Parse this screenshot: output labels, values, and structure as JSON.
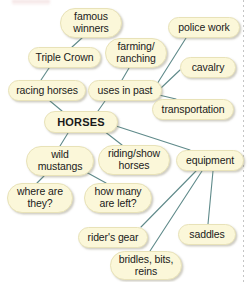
{
  "diagram": {
    "colors": {
      "node_fill": "#fbf7d9",
      "node_border": "#e8e2b8",
      "edge_line": "#5f8a8a",
      "text": "#1a1a1a",
      "background": "#ffffff"
    },
    "nodes": [
      {
        "id": "famous-winners",
        "label": "famous\nwinners",
        "x": 60,
        "y": 8,
        "w": 62,
        "h": 30,
        "central": false
      },
      {
        "id": "police-work",
        "label": "police work",
        "x": 168,
        "y": 17,
        "w": 72,
        "h": 21,
        "central": false
      },
      {
        "id": "farming-ranching",
        "label": "farming/\nranching",
        "x": 105,
        "y": 38,
        "w": 62,
        "h": 30,
        "central": false
      },
      {
        "id": "triple-crown",
        "label": "Triple Crown",
        "x": 28,
        "y": 47,
        "w": 73,
        "h": 21,
        "central": false
      },
      {
        "id": "cavalry",
        "label": "cavalry",
        "x": 180,
        "y": 57,
        "w": 56,
        "h": 21,
        "central": false
      },
      {
        "id": "racing-horses",
        "label": "racing horses",
        "x": 8,
        "y": 80,
        "w": 78,
        "h": 21,
        "central": false
      },
      {
        "id": "uses-in-past",
        "label": "uses in past",
        "x": 88,
        "y": 80,
        "w": 74,
        "h": 21,
        "central": false
      },
      {
        "id": "transportation",
        "label": "transportation",
        "x": 152,
        "y": 99,
        "w": 82,
        "h": 21,
        "central": false
      },
      {
        "id": "horses",
        "label": "HORSES",
        "x": 44,
        "y": 111,
        "w": 74,
        "h": 22,
        "central": true
      },
      {
        "id": "wild-mustangs",
        "label": "wild\nmustangs",
        "x": 26,
        "y": 146,
        "w": 68,
        "h": 30,
        "central": false
      },
      {
        "id": "riding-show-horses",
        "label": "riding/show\nhorses",
        "x": 98,
        "y": 145,
        "w": 72,
        "h": 30,
        "central": false
      },
      {
        "id": "equipment",
        "label": "equipment",
        "x": 176,
        "y": 150,
        "w": 68,
        "h": 21,
        "central": false
      },
      {
        "id": "where-are-they",
        "label": "where are\nthey?",
        "x": 7,
        "y": 183,
        "w": 66,
        "h": 30,
        "central": false
      },
      {
        "id": "how-many-left",
        "label": "how many\nare left?",
        "x": 84,
        "y": 183,
        "w": 68,
        "h": 30,
        "central": false
      },
      {
        "id": "riders-gear",
        "label": "rider's gear",
        "x": 78,
        "y": 227,
        "w": 70,
        "h": 21,
        "central": false
      },
      {
        "id": "saddles",
        "label": "saddles",
        "x": 178,
        "y": 224,
        "w": 58,
        "h": 21,
        "central": false
      },
      {
        "id": "bridles-bits-reins",
        "label": "bridles, bits,\nreins",
        "x": 110,
        "y": 251,
        "w": 72,
        "h": 29,
        "central": false
      }
    ],
    "edges": [
      {
        "id": "edge-triple-crown-famous-winners",
        "from": "triple-crown",
        "to": "famous-winners",
        "x1": 72,
        "y1": 47,
        "x2": 82,
        "y2": 38
      },
      {
        "id": "edge-racing-horses-triple-crown",
        "from": "racing-horses",
        "to": "triple-crown",
        "x1": 41,
        "y1": 80,
        "x2": 49,
        "y2": 68
      },
      {
        "id": "edge-racing-horses-horses",
        "from": "racing-horses",
        "to": "horses",
        "x1": 50,
        "y1": 101,
        "x2": 62,
        "y2": 111
      },
      {
        "id": "edge-uses-farming-ranching",
        "from": "uses-in-past",
        "to": "farming-ranching",
        "x1": 122,
        "y1": 80,
        "x2": 129,
        "y2": 68
      },
      {
        "id": "edge-uses-police-work",
        "from": "uses-in-past",
        "to": "police-work",
        "x1": 157,
        "y1": 84,
        "x2": 186,
        "y2": 38
      },
      {
        "id": "edge-uses-cavalry",
        "from": "uses-in-past",
        "to": "cavalry",
        "x1": 161,
        "y1": 88,
        "x2": 180,
        "y2": 70
      },
      {
        "id": "edge-uses-transportation",
        "from": "uses-in-past",
        "to": "transportation",
        "x1": 159,
        "y1": 95,
        "x2": 176,
        "y2": 99
      },
      {
        "id": "edge-uses-horses",
        "from": "uses-in-past",
        "to": "horses",
        "x1": 105,
        "y1": 101,
        "x2": 98,
        "y2": 111
      },
      {
        "id": "edge-horses-wild-mustangs",
        "from": "horses",
        "to": "wild-mustangs",
        "x1": 68,
        "y1": 133,
        "x2": 60,
        "y2": 146
      },
      {
        "id": "edge-horses-riding-show-horses",
        "from": "horses",
        "to": "riding-show-horses",
        "x1": 104,
        "y1": 131,
        "x2": 122,
        "y2": 145
      },
      {
        "id": "edge-horses-equipment",
        "from": "horses",
        "to": "equipment",
        "x1": 116,
        "y1": 126,
        "x2": 190,
        "y2": 150
      },
      {
        "id": "edge-wild-mustangs-where-are-they",
        "from": "wild-mustangs",
        "to": "where-are-they",
        "x1": 44,
        "y1": 176,
        "x2": 37,
        "y2": 183
      },
      {
        "id": "edge-wild-mustangs-how-many-left",
        "from": "wild-mustangs",
        "to": "how-many-left",
        "x1": 86,
        "y1": 172,
        "x2": 106,
        "y2": 183
      },
      {
        "id": "edge-equipment-riders-gear",
        "from": "equipment",
        "to": "riders-gear",
        "x1": 196,
        "y1": 171,
        "x2": 141,
        "y2": 227
      },
      {
        "id": "edge-equipment-bridles-bits-reins",
        "from": "equipment",
        "to": "bridles-bits-reins",
        "x1": 202,
        "y1": 171,
        "x2": 150,
        "y2": 251
      },
      {
        "id": "edge-equipment-saddles",
        "from": "equipment",
        "to": "saddles",
        "x1": 213,
        "y1": 171,
        "x2": 208,
        "y2": 224
      }
    ]
  }
}
